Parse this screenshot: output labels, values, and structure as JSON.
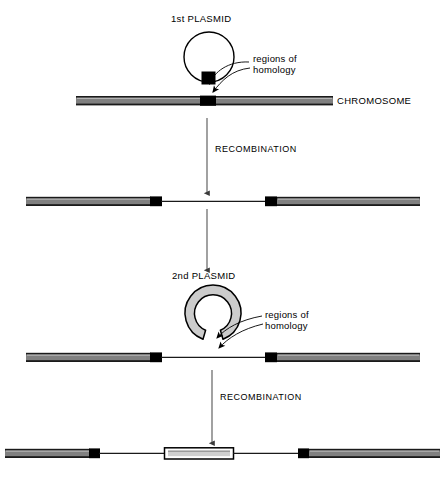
{
  "figure": {
    "background_color": "#ffffff",
    "width": 446,
    "height": 484
  },
  "colors": {
    "bar_fill": "#808080",
    "bar_edge_dark": "#1a1a1a",
    "bar_edge_light": "#b3b3b3",
    "block_black": "#000000",
    "plasmid_ring_fill": "#cccccc",
    "plasmid_outline": "#000000",
    "integrated_segment_fill": "#d9d9d9",
    "line": "#4d4d4d",
    "text": "#000000"
  },
  "labels": {
    "first_plasmid": "1st PLASMID",
    "second_plasmid": "2nd PLASMID",
    "regions_of_homology_line1": "regions of",
    "regions_of_homology_line2": "homology",
    "chromosome": "CHROMOSOME",
    "recombination_step1": "RECOMBINATION",
    "recombination_step2": "RECOMBINATION"
  },
  "stages": [
    {
      "id": "stage-1",
      "name": "first-plasmid-aligns-with-chromosome",
      "y": 101,
      "description": "Circular 1st plasmid with a black homology block sits above an intact chromosome bearing a matching black homology region.",
      "chromosome": {
        "x1": 76,
        "x2": 333,
        "homology_block_x": 200,
        "homology_block_width": 16
      },
      "plasmid": {
        "type": "thin-circle",
        "cx": 209,
        "cy": 57,
        "r": 25,
        "homology_block": {
          "x": 202,
          "y": 72,
          "width": 14,
          "height": 13
        }
      }
    },
    {
      "id": "stage-2",
      "name": "after-first-recombination",
      "y": 201,
      "description": "First plasmid has integrated; the chromosome is now two gray arms joined by a thin line, each arm capped by a black homology block.",
      "left_bar": {
        "x1": 26,
        "x2": 162,
        "block_x": 150,
        "block_width": 12
      },
      "right_bar": {
        "x1": 265,
        "x2": 420,
        "block_x": 265,
        "block_width": 12
      },
      "connector": {
        "x1": 162,
        "x2": 265
      }
    },
    {
      "id": "stage-3",
      "name": "second-plasmid-aligns-with-recombinant",
      "y": 357,
      "description": "Thick gray ring (2nd plasmid) with a gap at its base sits above the recombinant chromosome.",
      "left_bar": {
        "x1": 26,
        "x2": 162,
        "block_x": 150,
        "block_width": 12
      },
      "right_bar": {
        "x1": 265,
        "x2": 420,
        "block_x": 265,
        "block_width": 12
      },
      "connector": {
        "x1": 162,
        "x2": 265
      },
      "plasmid": {
        "type": "thick-ring",
        "cx": 213,
        "cy": 313,
        "outer_r": 28,
        "inner_r": 18,
        "gap_at": "bottom"
      }
    },
    {
      "id": "stage-4",
      "name": "after-second-recombination",
      "y": 453,
      "description": "Final product: left gray arm with black block, thin line, integrated light outlined segment from 2nd plasmid, thin line, black block and right gray arm.",
      "left_bar": {
        "x1": 5,
        "x2": 100,
        "block_x": 89,
        "block_width": 11
      },
      "middle_segment": {
        "x1": 164,
        "x2": 234
      },
      "right_bar": {
        "x1": 298,
        "x2": 440,
        "block_x": 298,
        "block_width": 11
      },
      "connector_left": {
        "x1": 100,
        "x2": 164
      },
      "connector_right": {
        "x1": 234,
        "x2": 298
      }
    }
  ],
  "arrows": [
    {
      "id": "arrow-recombination-1",
      "name": "recombination-arrow-1",
      "x": 207,
      "y1": 120,
      "y2": 196,
      "label": "RECOMBINATION",
      "label_x": 215,
      "label_y": 150
    },
    {
      "id": "arrow-recombination-2",
      "name": "recombination-arrow-2",
      "x": 212,
      "y1": 370,
      "y2": 446,
      "label": "RECOMBINATION",
      "label_x": 220,
      "label_y": 398
    },
    {
      "id": "arrow-stage2-to-stage3",
      "name": "flow-arrow-2",
      "x": 207,
      "y1": 210,
      "y2": 272,
      "label": "",
      "label_x": 0,
      "label_y": 0
    }
  ],
  "annotations": [
    {
      "id": "homology-callout-1",
      "name": "regions-of-homology-callout-top",
      "text_x": 253,
      "text_y": 62,
      "points_to": [
        {
          "x": 209,
          "y": 88
        },
        {
          "x": 214,
          "y": 95
        }
      ]
    },
    {
      "id": "homology-callout-2",
      "name": "regions-of-homology-callout-bottom",
      "text_x": 265,
      "text_y": 318,
      "points_to": [
        {
          "x": 214,
          "y": 340
        },
        {
          "x": 216,
          "y": 350
        }
      ]
    }
  ]
}
